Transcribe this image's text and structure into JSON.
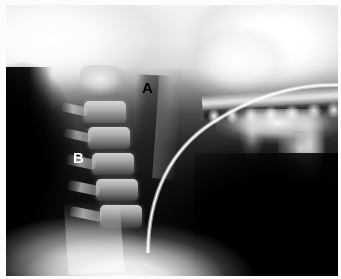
{
  "figure": {
    "kind": "radiograph",
    "modality": "plain-film x-ray",
    "view": "lateral cervical spine / soft tissue neck",
    "width_px": 341,
    "height_px": 279,
    "frame_color": "#fcfcfc",
    "background_color": "#000000"
  },
  "annotations": {
    "labels": [
      {
        "id": "A",
        "text": "A",
        "color": "#000000",
        "x": 143,
        "y": 83,
        "on_background": "light",
        "points_to": "retropharyngeal / prevertebral soft tissue region"
      },
      {
        "id": "B",
        "text": "B",
        "color": "#ffffff",
        "x": 74,
        "y": 153,
        "on_background": "dark",
        "points_to": "posterior cervical soft tissue / air shadow"
      }
    ]
  },
  "anatomy": {
    "regions": [
      {
        "name": "occiput-skull-base",
        "brightness": "bright",
        "location": "upper-left"
      },
      {
        "name": "maxilla-facial-bones",
        "brightness": "very-bright",
        "location": "upper-right"
      },
      {
        "name": "hard-palate",
        "brightness": "bright",
        "location": "right"
      },
      {
        "name": "maxillary-teeth",
        "brightness": "very-bright",
        "location": "right"
      },
      {
        "name": "mandible-body-ramus",
        "brightness": "bright",
        "location": "center-right"
      },
      {
        "name": "cervical-vertebrae",
        "brightness": "mid-gray",
        "location": "center-left"
      },
      {
        "name": "pharyngeal-air-column",
        "brightness": "dark",
        "location": "center"
      },
      {
        "name": "posterior-neck-air",
        "brightness": "black",
        "location": "left"
      },
      {
        "name": "submandibular-space",
        "brightness": "black",
        "location": "lower-right"
      },
      {
        "name": "shoulder-soft-tissue",
        "brightness": "bright",
        "location": "bottom-center"
      }
    ],
    "vertebrae": [
      {
        "level": "C2",
        "x": 74,
        "y": 62,
        "w": 46,
        "h": 30
      },
      {
        "level": "C3",
        "x": 78,
        "y": 96,
        "w": 42,
        "h": 22
      },
      {
        "level": "C4",
        "x": 82,
        "y": 122,
        "w": 42,
        "h": 22
      },
      {
        "level": "C5",
        "x": 86,
        "y": 148,
        "w": 42,
        "h": 22
      },
      {
        "level": "C6",
        "x": 90,
        "y": 174,
        "w": 42,
        "h": 22
      },
      {
        "level": "C7",
        "x": 94,
        "y": 200,
        "w": 42,
        "h": 22
      }
    ],
    "device": {
      "name": "radiopaque-tube",
      "description": "thin bright curved linear density arcing from upper right to lower center",
      "path_start": {
        "x": 330,
        "y": 84
      },
      "path_end": {
        "x": 150,
        "y": 252
      }
    }
  }
}
